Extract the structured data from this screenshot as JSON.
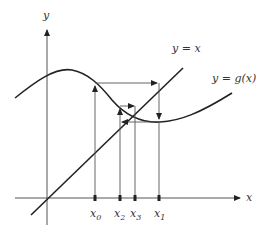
{
  "diagram": {
    "axes": {
      "x_label": "x",
      "y_label": "y"
    },
    "curves": [
      {
        "name": "identity-line",
        "label": "y = x"
      },
      {
        "name": "g-curve",
        "label": "y = g(x)"
      }
    ],
    "ticks": [
      {
        "base": "x",
        "sub": "0"
      },
      {
        "base": "x",
        "sub": "2"
      },
      {
        "base": "x",
        "sub": "3"
      },
      {
        "base": "x",
        "sub": "1"
      }
    ],
    "colors": {
      "line": "#222222",
      "thin": "#555555",
      "text": "#333333"
    }
  }
}
